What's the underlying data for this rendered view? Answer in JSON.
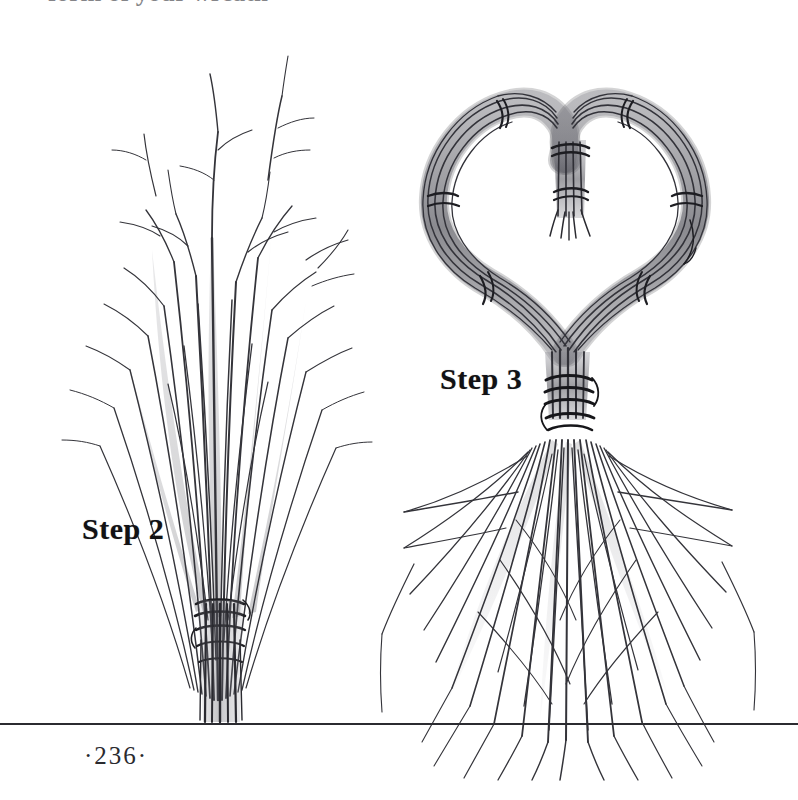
{
  "page": {
    "folio": "·236·",
    "background_color": "#ffffff",
    "ink_color": "#2b2b30",
    "top_clipped_text": "form of your wreath",
    "width": 798,
    "height": 800
  },
  "figures": [
    {
      "id": "step-2",
      "label": "Step 2",
      "caption_position": "left",
      "description": "A tall upright bundle of bare twigs gathered and bound near the base with several wraps of wire or twine, tips fanning upward and outward."
    },
    {
      "id": "step-3",
      "label": "Step 3",
      "caption_position": "left",
      "description": "The bound twig bundle bent and tied into a heart shape, with a small tied tassel hanging at the center cleft and the cut ends splaying below the binding into a broom-like skirt."
    }
  ],
  "rule": {
    "name": "baseline-rule",
    "y": 723,
    "color": "#2b2b30"
  }
}
